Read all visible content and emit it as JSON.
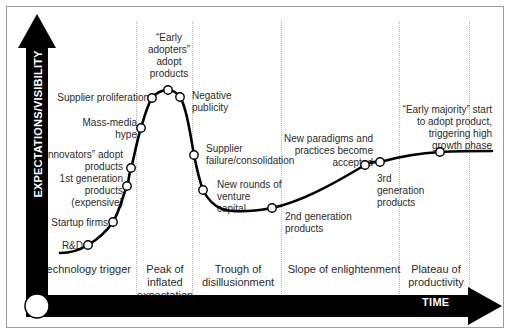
{
  "figure": {
    "y_axis_label": "EXPECTATIONS/VISIBILITY",
    "x_axis_label": "TIME",
    "axis_color": "#000000",
    "curve_color": "#000000",
    "gridline_color": "#b4b4b4",
    "marker_fill": "#ffffff",
    "background": "#ffffff"
  },
  "phases": [
    {
      "label": "Technology\ntrigger"
    },
    {
      "label": "Peak of\ninflated\nexpectation"
    },
    {
      "label": "Trough of\ndisillusionment"
    },
    {
      "label": "Slope of\nenlightenment"
    },
    {
      "label": "Plateau of\nproductivity"
    }
  ],
  "annotations": [
    {
      "label": "R&D"
    },
    {
      "label": "Startup firms"
    },
    {
      "label": "1st generation\nproducts\n(expensive)"
    },
    {
      "label": "“Innovators” adopt\nproducts"
    },
    {
      "label": "Mass-media\nhype"
    },
    {
      "label": "Supplier proliferation"
    },
    {
      "label": "“Early\nadopters”\nadopt\nproducts"
    },
    {
      "label": "Negative\npublicity"
    },
    {
      "label": "Supplier\nfailure/consolidation"
    },
    {
      "label": "New rounds of\nventure\ncapital"
    },
    {
      "label": "2nd generation\nproducts"
    },
    {
      "label": "New paradigms and\npractices become\naccepted"
    },
    {
      "label": "3rd\ngeneration\nproducts"
    },
    {
      "label": "“Early majority” start\nto adopt product,\ntriggering high\ngrowth phase"
    }
  ],
  "chart_data": {
    "type": "line",
    "title": "",
    "xlabel": "TIME",
    "ylabel": "EXPECTATIONS/VISIBILITY",
    "xlim": [
      0,
      510
    ],
    "ylim": [
      0,
      334
    ],
    "grid": true,
    "legend": "none",
    "phase_boundaries_x": [
      135,
      191,
      280,
      398,
      468
    ],
    "curve_path": "M 60,253 C 72,253 80,250 88,245 C 100,238 106,232 113,222 C 120,210 122,198 127,186 C 130,176 129,172 131,168 C 134,158 137,140 141,128 C 145,114 148,104 152,98 C 156,93 160,90 168,90 C 174,90 177,93 180,97 C 186,106 190,132 194,155 C 197,170 200,182 203,190 C 208,200 214,206 222,209 C 235,213 250,212 272,208 C 300,202 330,186 365,165 C 372,161 376,162 380,162 C 398,157 420,153 440,152 C 460,151 478,151 492,151",
    "markers": [
      {
        "x": 88,
        "y": 245,
        "label": "R&D"
      },
      {
        "x": 113,
        "y": 222,
        "label": "Startup firms"
      },
      {
        "x": 127,
        "y": 186,
        "label": "1st generation products (expensive)"
      },
      {
        "x": 131,
        "y": 168,
        "label": "“Innovators” adopt products"
      },
      {
        "x": 141,
        "y": 128,
        "label": "Mass-media hype"
      },
      {
        "x": 152,
        "y": 98,
        "label": "Supplier proliferation"
      },
      {
        "x": 168,
        "y": 90,
        "label": "“Early adopters” adopt products"
      },
      {
        "x": 180,
        "y": 97,
        "label": "Negative publicity"
      },
      {
        "x": 194,
        "y": 155,
        "label": "Supplier failure/consolidation"
      },
      {
        "x": 203,
        "y": 190,
        "label": "New rounds of venture capital"
      },
      {
        "x": 272,
        "y": 208,
        "label": "2nd generation products"
      },
      {
        "x": 365,
        "y": 165,
        "label": "New paradigms and practices become accepted"
      },
      {
        "x": 380,
        "y": 162,
        "label": "3rd generation products"
      },
      {
        "x": 440,
        "y": 152,
        "label": "“Early majority” start to adopt product, triggering high growth phase"
      }
    ]
  }
}
